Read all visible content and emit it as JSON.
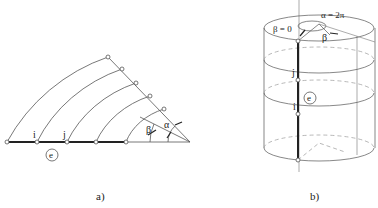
{
  "figure": {
    "panel_a": {
      "caption": "a)",
      "node_labels": {
        "i": "i",
        "j": "j"
      },
      "element_label": "e",
      "angle_labels": {
        "alpha": "α",
        "beta": "β"
      }
    },
    "panel_b": {
      "caption": "b)",
      "node_labels": {
        "i": "i",
        "j": "j"
      },
      "element_label": "e",
      "angle_labels": {
        "alpha_eq": "α = 2π",
        "beta_zero": "β = 0",
        "beta": "β"
      }
    }
  }
}
